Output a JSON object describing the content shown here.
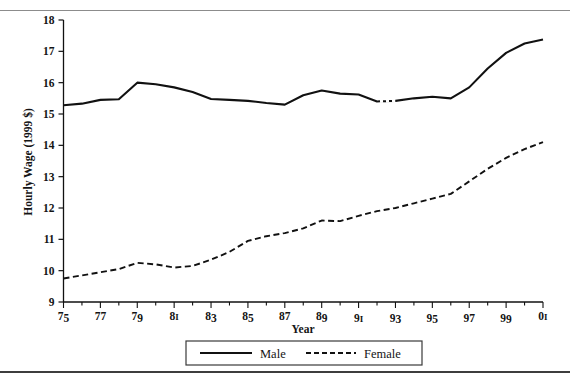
{
  "figure": {
    "rule_top": true,
    "rule_bottom": true
  },
  "axes": {
    "y_title": "Hourly Wage (1999 $)",
    "x_title": "Year",
    "y_ticks": [
      "9",
      "10",
      "11",
      "12",
      "13",
      "14",
      "15",
      "16",
      "17",
      "18"
    ],
    "x_ticks": [
      "75",
      "77",
      "79",
      "81",
      "83",
      "85",
      "87",
      "89",
      "91",
      "93",
      "95",
      "97",
      "99",
      "01"
    ]
  },
  "legend": {
    "items": [
      {
        "label": "Male",
        "style": "solid",
        "color": "#111111"
      },
      {
        "label": "Female",
        "style": "dashed",
        "color": "#111111"
      }
    ]
  },
  "chart_data": {
    "type": "line",
    "title": "",
    "xlabel": "Year",
    "ylabel": "Hourly Wage (1999 $)",
    "xlim": [
      1975,
      2001
    ],
    "ylim": [
      9,
      18
    ],
    "grid": false,
    "legend_position": "bottom-center",
    "x": [
      1975,
      1976,
      1977,
      1978,
      1979,
      1980,
      1981,
      1982,
      1983,
      1984,
      1985,
      1986,
      1987,
      1988,
      1989,
      1990,
      1991,
      1992,
      1993,
      1994,
      1995,
      1996,
      1997,
      1998,
      1999,
      2000,
      2001
    ],
    "x_tick_labels": [
      "75",
      "77",
      "79",
      "81",
      "83",
      "85",
      "87",
      "89",
      "91",
      "93",
      "95",
      "97",
      "99",
      "01"
    ],
    "x_tick_values": [
      1975,
      1977,
      1979,
      1981,
      1983,
      1985,
      1987,
      1989,
      1991,
      1993,
      1995,
      1997,
      1999,
      2001
    ],
    "series": [
      {
        "name": "Male",
        "style": "solid",
        "color": "#111111",
        "note": "short dashed discontinuity between 1992 and 1993",
        "values": [
          15.28,
          15.33,
          15.45,
          15.47,
          16.0,
          15.95,
          15.85,
          15.7,
          15.48,
          15.45,
          15.42,
          15.35,
          15.3,
          15.6,
          15.75,
          15.65,
          15.62,
          15.4,
          15.42,
          15.5,
          15.55,
          15.5,
          15.85,
          16.45,
          16.95,
          17.25,
          17.38
        ]
      },
      {
        "name": "Female",
        "style": "dashed",
        "color": "#111111",
        "values": [
          9.75,
          9.85,
          9.95,
          10.05,
          10.25,
          10.2,
          10.1,
          10.15,
          10.35,
          10.6,
          10.95,
          11.1,
          11.2,
          11.35,
          11.6,
          11.58,
          11.75,
          11.9,
          12.0,
          12.15,
          12.3,
          12.45,
          12.85,
          13.25,
          13.6,
          13.88,
          14.1
        ]
      }
    ]
  }
}
